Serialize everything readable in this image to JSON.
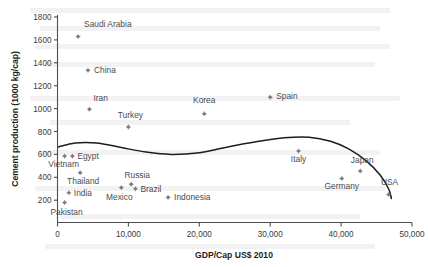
{
  "chart_data": {
    "type": "scatter",
    "title": "",
    "xlabel": "GDP/Cap US$ 2010",
    "ylabel": "Cement production (1000 kg/cap)",
    "xlim": [
      0,
      50000
    ],
    "ylim": [
      0,
      1800
    ],
    "xticks": [
      0,
      10000,
      20000,
      30000,
      40000,
      50000
    ],
    "xticklabels": [
      "0",
      "10,000",
      "20,000",
      "30,000",
      "40,000",
      "50,000"
    ],
    "yticks": [
      200,
      400,
      600,
      800,
      1000,
      1200,
      1400,
      1600,
      1800
    ],
    "yticklabels": [
      "200",
      "400",
      "600",
      "800",
      "1000",
      "1200",
      "1400",
      "1600",
      "1800"
    ],
    "grid": false,
    "legend": false,
    "marker_color": "#77777e",
    "curve_color": "#1d1d20",
    "points": [
      {
        "label": "Saudi Arabia",
        "x": 2900,
        "y": 1630,
        "label_dx": 6,
        "label_dy": -9,
        "anchor": "start"
      },
      {
        "label": "China",
        "x": 4300,
        "y": 1335,
        "label_dx": 6,
        "label_dy": 3,
        "anchor": "start"
      },
      {
        "label": "Iran",
        "x": 4500,
        "y": 995,
        "label_dx": 4,
        "label_dy": -8,
        "anchor": "start"
      },
      {
        "label": "Turkey",
        "x": 10000,
        "y": 840,
        "label_dx": 2,
        "label_dy": -9,
        "anchor": "middle"
      },
      {
        "label": "Korea",
        "x": 20700,
        "y": 955,
        "label_dx": 0,
        "label_dy": -11,
        "anchor": "middle"
      },
      {
        "label": "Spain",
        "x": 30000,
        "y": 1100,
        "label_dx": 6,
        "label_dy": 2,
        "anchor": "start"
      },
      {
        "label": "Italy",
        "x": 34000,
        "y": 630,
        "label_dx": 0,
        "label_dy": 11,
        "anchor": "middle"
      },
      {
        "label": "Japan",
        "x": 42700,
        "y": 455,
        "label_dx": 2,
        "label_dy": -8,
        "anchor": "middle"
      },
      {
        "label": "Germany",
        "x": 40100,
        "y": 390,
        "label_dx": 0,
        "label_dy": 11,
        "anchor": "middle"
      },
      {
        "label": "USA",
        "x": 46700,
        "y": 250,
        "label_dx": 1,
        "label_dy": -9,
        "anchor": "middle"
      },
      {
        "label": "Vietnam",
        "x": 1000,
        "y": 585,
        "label_dx": -1,
        "label_dy": 11,
        "anchor": "middle"
      },
      {
        "label": "Egypt",
        "x": 2100,
        "y": 585,
        "label_dx": 5,
        "label_dy": 3,
        "anchor": "start"
      },
      {
        "label": "Thailand",
        "x": 3200,
        "y": 440,
        "label_dx": 3,
        "label_dy": 11,
        "anchor": "middle"
      },
      {
        "label": "India",
        "x": 1600,
        "y": 265,
        "label_dx": 5,
        "label_dy": 3,
        "anchor": "start"
      },
      {
        "label": "Pakistan",
        "x": 1000,
        "y": 180,
        "label_dx": 2,
        "label_dy": 13,
        "anchor": "middle"
      },
      {
        "label": "Mexico",
        "x": 9000,
        "y": 310,
        "label_dx": -2,
        "label_dy": 12,
        "anchor": "middle"
      },
      {
        "label": "Russia",
        "x": 10400,
        "y": 340,
        "label_dx": 6,
        "label_dy": -6,
        "anchor": "middle"
      },
      {
        "label": "Brazil",
        "x": 11000,
        "y": 300,
        "label_dx": 5,
        "label_dy": 3,
        "anchor": "start"
      },
      {
        "label": "Indonesia",
        "x": 15600,
        "y": 225,
        "label_dx": 6,
        "label_dy": 3,
        "anchor": "start"
      }
    ],
    "trend_curve": {
      "description": "fitted inverted-U trend line",
      "points": [
        {
          "x": 150,
          "y": 665
        },
        {
          "x": 2500,
          "y": 700
        },
        {
          "x": 5500,
          "y": 700
        },
        {
          "x": 9000,
          "y": 660
        },
        {
          "x": 12500,
          "y": 620
        },
        {
          "x": 16000,
          "y": 600
        },
        {
          "x": 20000,
          "y": 615
        },
        {
          "x": 24000,
          "y": 665
        },
        {
          "x": 28000,
          "y": 710
        },
        {
          "x": 32000,
          "y": 745
        },
        {
          "x": 35500,
          "y": 750
        },
        {
          "x": 38500,
          "y": 715
        },
        {
          "x": 41000,
          "y": 650
        },
        {
          "x": 43500,
          "y": 545
        },
        {
          "x": 45500,
          "y": 420
        },
        {
          "x": 46700,
          "y": 300
        },
        {
          "x": 47100,
          "y": 215
        }
      ]
    }
  }
}
